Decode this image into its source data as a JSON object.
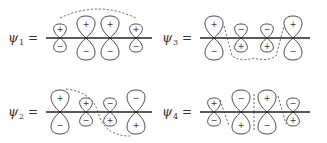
{
  "diagram": {
    "panels": [
      {
        "id": "psi1",
        "label": "ψ",
        "subscript": "1",
        "equals": "=",
        "origin": [
          46,
          38
        ],
        "axis_length": 106,
        "orbitals": [
          {
            "x": 14,
            "up_size": "small",
            "up_sign": "+",
            "down_sign": "−"
          },
          {
            "x": 40,
            "up_size": "large",
            "up_sign": "+",
            "down_sign": "−"
          },
          {
            "x": 64,
            "up_size": "large",
            "up_sign": "+",
            "down_sign": "−"
          },
          {
            "x": 90,
            "up_size": "small",
            "up_sign": "+",
            "down_sign": "−"
          }
        ],
        "node_path": "M 14 -20 Q 52 -38 90 -20"
      },
      {
        "id": "psi3",
        "label": "ψ",
        "subscript": "3",
        "equals": "=",
        "origin": [
          200,
          38
        ],
        "axis_length": 110,
        "orbitals": [
          {
            "x": 14,
            "up_size": "large",
            "up_sign": "+",
            "down_sign": "−"
          },
          {
            "x": 41,
            "up_size": "small",
            "up_sign": "−",
            "down_sign": "+"
          },
          {
            "x": 67,
            "up_size": "small",
            "up_sign": "−",
            "down_sign": "+"
          },
          {
            "x": 93,
            "up_size": "large",
            "up_sign": "+",
            "down_sign": "−"
          }
        ],
        "node_path": "M 24 -12 L 32 18 Q 41 24 54 20 Q 67 24 76 18 L 84 -12"
      },
      {
        "id": "psi2",
        "label": "ψ",
        "subscript": "2",
        "equals": "=",
        "origin": [
          46,
          112
        ],
        "axis_length": 106,
        "orbitals": [
          {
            "x": 14,
            "up_size": "large",
            "up_sign": "+",
            "down_sign": "−"
          },
          {
            "x": 40,
            "up_size": "small",
            "up_sign": "+",
            "down_sign": "−"
          },
          {
            "x": 64,
            "up_size": "small",
            "up_sign": "−",
            "down_sign": "+"
          },
          {
            "x": 90,
            "up_size": "large",
            "up_sign": "−",
            "down_sign": "+"
          }
        ],
        "node_path": "M 20 -23 Q 46 -20 52 0 Q 58 24 84 24"
      },
      {
        "id": "psi4",
        "label": "ψ",
        "subscript": "4",
        "equals": "=",
        "origin": [
          200,
          112
        ],
        "axis_length": 110,
        "orbitals": [
          {
            "x": 14,
            "up_size": "small",
            "up_sign": "+",
            "down_sign": "−"
          },
          {
            "x": 41,
            "up_size": "large",
            "up_sign": "−",
            "down_sign": "+"
          },
          {
            "x": 67,
            "up_size": "large",
            "up_sign": "+",
            "down_sign": "−"
          },
          {
            "x": 93,
            "up_size": "small",
            "up_sign": "−",
            "down_sign": "+"
          }
        ],
        "node_path": "M 20 -12 L 29 14 M 54 -18 L 54 0 M 54 0 L 54 18 M 78 -16 L 86 12"
      }
    ]
  }
}
